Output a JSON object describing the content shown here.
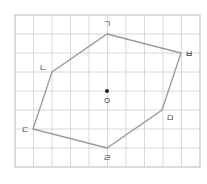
{
  "figure": {
    "grid": {
      "x0": 15,
      "y0": 15,
      "cols": 10,
      "rows": 8,
      "cellW": 18.5,
      "cellH": 19,
      "lineColor": "#d8d8d8",
      "borderColor": "#b8b8b8"
    },
    "polygon": {
      "stroke": "#999999"
    },
    "center": {
      "label": "ㅇ",
      "x": 107,
      "y": 91
    },
    "vertices": [
      {
        "label": "ㄱ",
        "x": 107,
        "y": 34
      },
      {
        "label": "ㅂ",
        "x": 181,
        "y": 53
      },
      {
        "label": "ㅁ",
        "x": 162,
        "y": 110
      },
      {
        "label": "ㄹ",
        "x": 107,
        "y": 148
      },
      {
        "label": "ㄷ",
        "x": 33,
        "y": 129
      },
      {
        "label": "ㄴ",
        "x": 52,
        "y": 72
      }
    ],
    "labels": {
      "v1": "ㄱ",
      "v2": "ㄴ",
      "v3": "ㄷ",
      "v4": "ㄹ",
      "v5": "ㅁ",
      "v6": "ㅂ",
      "center": "ㅇ"
    }
  }
}
